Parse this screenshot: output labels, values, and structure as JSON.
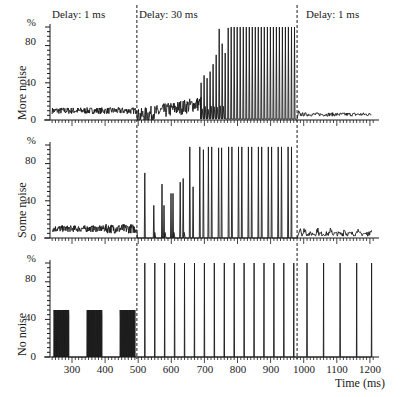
{
  "chart_data": [
    {
      "type": "line",
      "panel": "top",
      "ylabel": "More noise",
      "y_unit": "%",
      "ylim": [
        0,
        100
      ],
      "yticks": [
        0,
        40,
        80
      ],
      "xlim": [
        233,
        1210
      ],
      "annotations": [
        "Delay: 1 ms",
        "Delay: 30 ms",
        "Delay: 1 ms"
      ],
      "phase_boundaries_ms": [
        496,
        980
      ],
      "description": "Noisy baseline ~10% during first 1 ms delay phase; during 30 ms delay phase activity grows from ~10-25% noise into periodic spikes rising to 100% by ~700 ms; returns to ~5-8% noise after 980 ms",
      "segments": [
        {
          "x_range": [
            240,
            496
          ],
          "level": 10,
          "noise": 3
        },
        {
          "x_range": [
            496,
            680
          ],
          "level_start": 5,
          "level_end": 20,
          "noise": 8
        },
        {
          "x_range": [
            680,
            980
          ],
          "spikes": true,
          "spike_heights": [
            40,
            48,
            45,
            52,
            60,
            70,
            98,
            82,
            72,
            99,
            100,
            100,
            100,
            100,
            100,
            100,
            100,
            100,
            100,
            100,
            100,
            100,
            100,
            100,
            100,
            100,
            100,
            100,
            100,
            100,
            100,
            100
          ]
        },
        {
          "x_range": [
            980,
            1200
          ],
          "level": 6,
          "noise": 2
        }
      ]
    },
    {
      "type": "line",
      "panel": "middle",
      "ylabel": "Some noise",
      "y_unit": "%",
      "ylim": [
        0,
        100
      ],
      "yticks": [
        0,
        40,
        80
      ],
      "phase_boundaries_ms": [
        496,
        980
      ],
      "spikes_ms": [
        520,
        547,
        572,
        578,
        599,
        605,
        627,
        636,
        656,
        666,
        686,
        697,
        712,
        722,
        743,
        752,
        773,
        783,
        803,
        813,
        833,
        843,
        863,
        873,
        893,
        903,
        923,
        933,
        953,
        963
      ],
      "spike_heights": [
        70,
        35,
        58,
        35,
        48,
        48,
        60,
        64,
        98,
        55,
        98,
        95,
        98,
        98,
        97,
        97,
        98,
        98,
        98,
        98,
        98,
        98,
        98,
        98,
        98,
        98,
        98,
        98,
        98,
        98
      ],
      "baseline": {
        "x_range": [
          240,
          496
        ],
        "level": 10,
        "noise": 4
      },
      "tail": {
        "x_range": [
          980,
          1200
        ],
        "level": 4,
        "noise": 3
      }
    },
    {
      "type": "line",
      "panel": "bottom",
      "ylabel": "No noise",
      "y_unit": "%",
      "ylim": [
        0,
        100
      ],
      "yticks": [
        0,
        40,
        80
      ],
      "xlabel": "Time (ms)",
      "xticks": [
        300,
        400,
        500,
        600,
        700,
        800,
        900,
        1000,
        1100,
        1200
      ],
      "phase_boundaries_ms": [
        496,
        980
      ],
      "bursts": [
        {
          "x_range": [
            245,
            290
          ],
          "height": 50
        },
        {
          "x_range": [
            345,
            390
          ],
          "height": 50
        },
        {
          "x_range": [
            445,
            490
          ],
          "height": 50
        }
      ],
      "spikes_ms": [
        520,
        550,
        580,
        610,
        640,
        670,
        700,
        730,
        760,
        790,
        820,
        850,
        880,
        910,
        940,
        970,
        1010,
        1060,
        1110,
        1160,
        1205
      ],
      "spike_height": 100
    }
  ],
  "labels": {
    "phase1": "Delay: 1 ms",
    "phase2": "Delay: 30 ms",
    "phase3": "Delay: 1 ms",
    "panel_top": "More noise",
    "panel_middle": "Some noise",
    "panel_bottom": "No noise",
    "percent": "%",
    "y80": "80",
    "y40": "40",
    "y0": "0",
    "xlabel": "Time (ms)",
    "x300": "300",
    "x400": "400",
    "x500": "500",
    "x600": "600",
    "x700": "700",
    "x800": "800",
    "x900": "900",
    "x1000": "1000",
    "x1100": "1100",
    "x1200": "1200"
  }
}
